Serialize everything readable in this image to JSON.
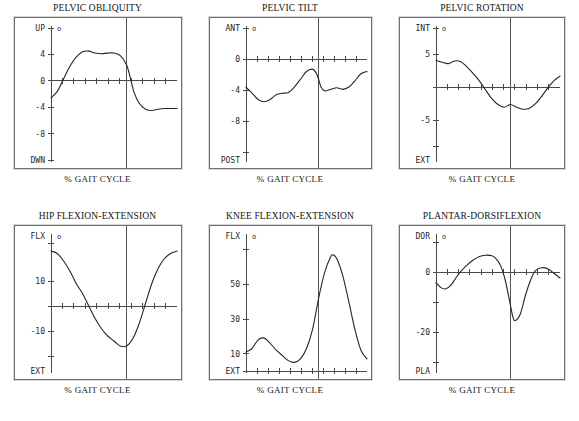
{
  "page": {
    "x_axis_label": "% GAIT CYCLE",
    "degree_symbol": "o",
    "curve_color": "#262626",
    "axis_color": "#4a4a4a",
    "frame_color": "#6f6f6f",
    "background": "#ffffff"
  },
  "chart_data": [
    {
      "id": "pelvic-obliquity",
      "type": "line",
      "title": "PELVIC OBLIQUITY",
      "xlabel": "% GAIT CYCLE",
      "ylabel": "",
      "unit": "o",
      "top_label": "UP",
      "bottom_label": "DWN",
      "ylim": [
        -12,
        8
      ],
      "xlim": [
        0,
        100
      ],
      "yticks": [
        8,
        4,
        0,
        -4,
        -8,
        -12
      ],
      "ytick_labels": [
        "",
        "4",
        "0",
        "-4",
        "-8",
        ""
      ],
      "zero_axis_y": 0,
      "xtick_count": 10,
      "toe_off": 60,
      "grid": false,
      "legend": "none",
      "x": [
        0,
        5,
        10,
        15,
        20,
        25,
        30,
        35,
        40,
        45,
        50,
        55,
        60,
        63,
        66,
        70,
        75,
        80,
        85,
        90,
        95,
        100
      ],
      "values": [
        -2.6,
        -1.6,
        0.3,
        2.2,
        3.6,
        4.4,
        4.5,
        4.2,
        4.1,
        4.2,
        4.2,
        3.8,
        2.4,
        0.4,
        -1.8,
        -3.4,
        -4.3,
        -4.5,
        -4.3,
        -4.2,
        -4.2,
        -4.2
      ]
    },
    {
      "id": "pelvic-tilt",
      "type": "line",
      "title": "PELVIC TILT",
      "xlabel": "% GAIT CYCLE",
      "ylabel": "",
      "unit": "o",
      "top_label": "ANT",
      "bottom_label": "POST",
      "ylim": [
        -13,
        4
      ],
      "xlim": [
        0,
        100
      ],
      "yticks": [
        4,
        0,
        -4,
        -8,
        -12
      ],
      "ytick_labels": [
        "",
        "0",
        "-4",
        "-8",
        ""
      ],
      "zero_axis_y": 0,
      "xtick_count": 10,
      "toe_off": 60,
      "grid": false,
      "legend": "none",
      "x": [
        0,
        5,
        10,
        15,
        20,
        25,
        30,
        35,
        40,
        45,
        50,
        55,
        58,
        60,
        62,
        65,
        70,
        75,
        80,
        85,
        90,
        95,
        100
      ],
      "values": [
        -3.6,
        -4.4,
        -5.2,
        -5.5,
        -5.2,
        -4.6,
        -4.4,
        -4.3,
        -3.6,
        -2.6,
        -1.6,
        -1.3,
        -1.8,
        -2.6,
        -3.6,
        -4.1,
        -3.9,
        -3.7,
        -3.9,
        -3.6,
        -2.8,
        -1.9,
        -1.6
      ]
    },
    {
      "id": "pelvic-rotation",
      "type": "line",
      "title": "PELVIC ROTATION",
      "xlabel": "% GAIT CYCLE",
      "ylabel": "",
      "unit": "o",
      "top_label": "INT",
      "bottom_label": "EXT",
      "ylim": [
        -11,
        9
      ],
      "xlim": [
        0,
        100
      ],
      "yticks": [
        9,
        5,
        0,
        -5,
        -9
      ],
      "ytick_labels": [
        "",
        "5",
        "",
        "-5",
        ""
      ],
      "zero_axis_y": 0,
      "xtick_count": 10,
      "toe_off": 60,
      "grid": false,
      "legend": "none",
      "x": [
        0,
        5,
        10,
        15,
        20,
        25,
        30,
        35,
        40,
        45,
        50,
        55,
        60,
        65,
        70,
        75,
        80,
        85,
        90,
        95,
        100
      ],
      "values": [
        4.1,
        3.8,
        3.6,
        4.0,
        3.9,
        3.1,
        2.1,
        1.0,
        -0.4,
        -1.7,
        -2.6,
        -3.0,
        -2.6,
        -3.0,
        -3.3,
        -3.2,
        -2.5,
        -1.4,
        -0.1,
        1.0,
        1.7
      ]
    },
    {
      "id": "hip-flexion-extension",
      "type": "line",
      "title": "HIP FLEXION-EXTENSION",
      "xlabel": "% GAIT CYCLE",
      "ylabel": "",
      "unit": "o",
      "top_label": "FLX",
      "bottom_label": "EXT",
      "ylim": [
        -26,
        28
      ],
      "xlim": [
        0,
        100
      ],
      "yticks": [
        25,
        10,
        0,
        -10,
        -20
      ],
      "ytick_labels": [
        "",
        "10",
        "",
        "-10",
        ""
      ],
      "zero_axis_y": 0,
      "xtick_count": 10,
      "toe_off": 60,
      "grid": false,
      "legend": "none",
      "x": [
        0,
        5,
        10,
        15,
        20,
        25,
        30,
        35,
        40,
        45,
        50,
        55,
        60,
        65,
        70,
        75,
        80,
        85,
        90,
        95,
        100
      ],
      "values": [
        22,
        21,
        18,
        14,
        9,
        5,
        0,
        -5,
        -9,
        -12,
        -14,
        -16,
        -16,
        -13,
        -7,
        1,
        9,
        15,
        19,
        21,
        22
      ]
    },
    {
      "id": "knee-flexion-extension",
      "type": "line",
      "title": "KNEE FLEXION-EXTENSION",
      "xlabel": "% GAIT CYCLE",
      "ylabel": "",
      "unit": "o",
      "top_label": "FLX",
      "bottom_label": "EXT",
      "ylim": [
        0,
        78
      ],
      "xlim": [
        0,
        100
      ],
      "yticks": [
        70,
        50,
        30,
        10,
        0
      ],
      "ytick_labels": [
        "",
        "50",
        "30",
        "10",
        ""
      ],
      "zero_axis_y": 0,
      "xtick_count": 10,
      "toe_off": 60,
      "grid": false,
      "legend": "none",
      "x": [
        0,
        5,
        10,
        15,
        20,
        25,
        30,
        35,
        40,
        45,
        50,
        55,
        60,
        65,
        70,
        72,
        75,
        80,
        85,
        90,
        95,
        100
      ],
      "values": [
        11,
        13,
        18,
        19,
        16,
        12,
        9,
        6,
        5,
        7,
        13,
        24,
        42,
        57,
        66,
        67,
        65,
        55,
        40,
        24,
        12,
        7
      ]
    },
    {
      "id": "plantar-dorsiflexion",
      "type": "line",
      "title": "PLANTAR-DORSIFLEXION",
      "xlabel": "% GAIT CYCLE",
      "ylabel": "",
      "unit": "o",
      "top_label": "DOR",
      "bottom_label": "PLA",
      "ylim": [
        -33,
        12
      ],
      "xlim": [
        0,
        100
      ],
      "yticks": [
        10,
        0,
        -10,
        -20,
        -30
      ],
      "ytick_labels": [
        "",
        "0",
        "",
        "-20",
        ""
      ],
      "zero_axis_y": 0,
      "xtick_count": 10,
      "toe_off": 60,
      "grid": false,
      "legend": "none",
      "x": [
        0,
        4,
        8,
        12,
        16,
        20,
        25,
        30,
        35,
        40,
        45,
        48,
        52,
        56,
        60,
        62,
        64,
        68,
        72,
        76,
        80,
        85,
        90,
        95,
        100
      ],
      "values": [
        -3.5,
        -5.2,
        -5.6,
        -4.4,
        -2.0,
        0.2,
        2.3,
        4.0,
        5.2,
        5.6,
        5.4,
        4.6,
        2.2,
        -3.0,
        -11.0,
        -15.0,
        -16.2,
        -14.0,
        -8.0,
        -3.0,
        0.4,
        1.4,
        1.1,
        -0.4,
        -2.0
      ]
    }
  ]
}
